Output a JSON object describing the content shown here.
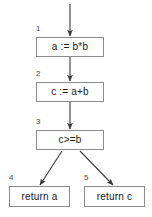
{
  "diagram": {
    "type": "control-flow-graph",
    "background_color": "#ffffff",
    "border_color": "#8c8c8c",
    "text_color": "#1a1a1a",
    "label_color": "#4d4d4d",
    "edge_color": "#3c3c3c",
    "nodes": [
      {
        "id": "1",
        "label": "1",
        "text": "a := b*b"
      },
      {
        "id": "2",
        "label": "2",
        "text": "c := a+b"
      },
      {
        "id": "3",
        "label": "3",
        "text": "c>=b"
      },
      {
        "id": "4",
        "label": "4",
        "text": "return a"
      },
      {
        "id": "5",
        "label": "5",
        "text": "return c"
      }
    ],
    "edges": [
      {
        "from": "entry",
        "to": "1"
      },
      {
        "from": "1",
        "to": "2"
      },
      {
        "from": "2",
        "to": "3"
      },
      {
        "from": "3",
        "to": "4"
      },
      {
        "from": "3",
        "to": "5"
      }
    ]
  }
}
